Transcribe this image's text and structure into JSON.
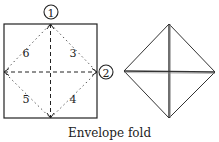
{
  "diagram": {
    "caption": "Envelope fold",
    "step_markers": [
      {
        "label": "1",
        "position": "top-center"
      },
      {
        "label": "2",
        "position": "right-middle"
      }
    ],
    "regions": [
      {
        "label": "6",
        "position": "upper-left"
      },
      {
        "label": "3",
        "position": "upper-right"
      },
      {
        "label": "5",
        "position": "lower-left"
      },
      {
        "label": "4",
        "position": "lower-right"
      }
    ],
    "colors": {
      "line": "#222222",
      "background": "#ffffff"
    }
  }
}
